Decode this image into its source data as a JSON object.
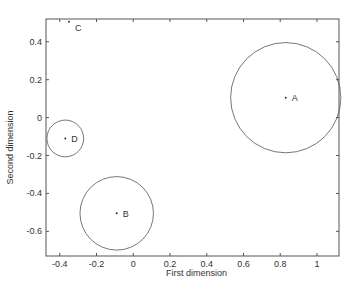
{
  "chart_data": {
    "type": "scatter",
    "title": "",
    "xlabel": "First dimension",
    "ylabel": "Second dimension",
    "xlim": [
      -0.475,
      1.12
    ],
    "ylim": [
      -0.73,
      0.52
    ],
    "xticks": [
      -0.4,
      -0.2,
      0,
      0.2,
      0.4,
      0.6,
      0.8,
      1
    ],
    "xtick_labels": [
      "-0.4",
      "-0.2",
      "0",
      "0.2",
      "0.4",
      "0.6",
      "0.8",
      "1"
    ],
    "yticks": [
      -0.6,
      -0.4,
      -0.2,
      0,
      0.2,
      0.4
    ],
    "ytick_labels": [
      "-0.6",
      "-0.4",
      "-0.2",
      "0",
      "0.2",
      "0.4"
    ],
    "grid": false,
    "legend": null,
    "points": [
      {
        "label": "A",
        "x": 0.83,
        "y": 0.105,
        "radius": 0.3
      },
      {
        "label": "B",
        "x": -0.09,
        "y": -0.505,
        "radius": 0.2
      },
      {
        "label": "C",
        "x": -0.35,
        "y": 0.505,
        "radius": 0
      },
      {
        "label": "D",
        "x": -0.37,
        "y": -0.11,
        "radius": 0.1
      }
    ],
    "colors": {
      "axis": "#555555",
      "circle": "#666666",
      "point": "#333333",
      "text": "#333333"
    }
  }
}
